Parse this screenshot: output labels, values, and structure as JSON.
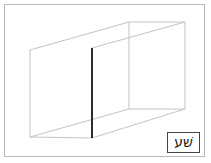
{
  "figure": {
    "background_color": "#ffffff",
    "frame": {
      "name": "outer-frame",
      "border_color": "#b9b9b9",
      "border_width_px": 1
    },
    "box": {
      "description": "Open rectangular prism drawn in thin light-gray wireframe, viewed from the front-left so the interior back wall is visible.",
      "line_color": "#c4c4c4",
      "line_width_px": 1,
      "vertices": {
        "front_top_left": [
          30,
          50
        ],
        "front_bottom_left": [
          30,
          137
        ],
        "back_top_left": [
          129,
          22
        ],
        "back_bottom_left": [
          129,
          109
        ],
        "back_top_right": [
          185,
          22
        ],
        "back_bottom_right": [
          185,
          109
        ],
        "front_top_right": [
          92,
          48
        ],
        "front_bottom_right": [
          92,
          138
        ]
      }
    },
    "highlight_edge": {
      "name": "bold-vertical-edge",
      "color": "#2b2b2b",
      "width_px": 2,
      "x": 92,
      "y_top": 48,
      "y_bottom": 138
    }
  },
  "label": {
    "text": "שׁע",
    "box_border_color": "#444444",
    "text_color": "#111111"
  }
}
